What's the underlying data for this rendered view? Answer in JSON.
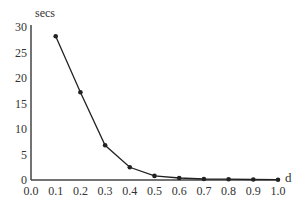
{
  "chart_data": {
    "type": "line",
    "title": "",
    "xlabel": "d",
    "ylabel": "secs",
    "x": [
      0.1,
      0.2,
      0.3,
      0.4,
      0.5,
      0.6,
      0.7,
      0.8,
      0.9,
      1.0
    ],
    "series": [
      {
        "name": "secs",
        "values": [
          28.2,
          17.2,
          6.8,
          2.5,
          0.8,
          0.4,
          0.2,
          0.15,
          0.1,
          0.05
        ],
        "color": "#222222",
        "marker": "circle"
      }
    ],
    "xlim": [
      0.0,
      1.0
    ],
    "ylim": [
      0,
      30
    ],
    "xticks": [
      "0.0",
      "0.1",
      "0.2",
      "0.3",
      "0.4",
      "0.5",
      "0.6",
      "0.7",
      "0.8",
      "0.9",
      "1.0"
    ],
    "yticks": [
      "0",
      "5",
      "10",
      "15",
      "20",
      "25",
      "30"
    ],
    "grid": false,
    "legend": null
  }
}
